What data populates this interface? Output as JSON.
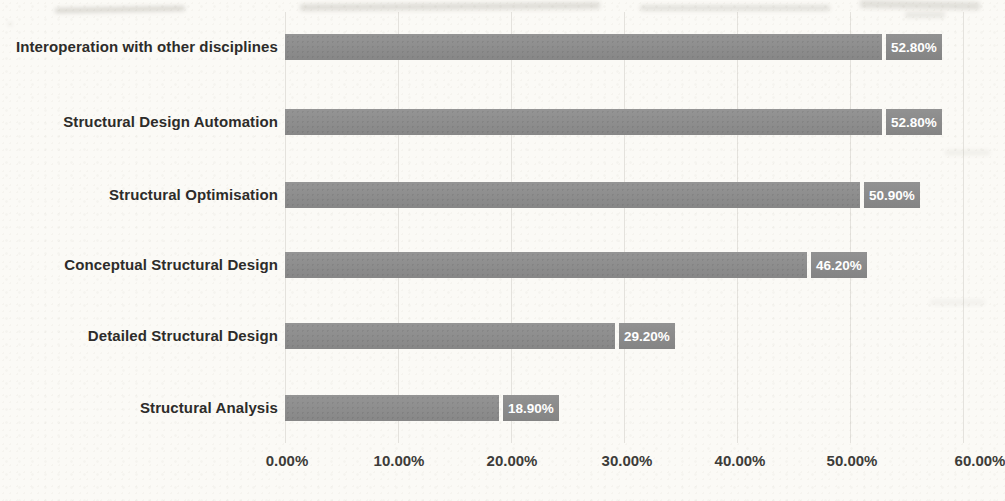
{
  "chart_data": {
    "type": "bar",
    "orientation": "horizontal",
    "title": "",
    "xlabel": "",
    "ylabel": "",
    "categories": [
      "Interoperation with other disciplines",
      "Structural Design Automation",
      "Structural Optimisation",
      "Conceptual Structural Design",
      "Detailed Structural Design",
      "Structural Analysis"
    ],
    "values": [
      52.8,
      52.8,
      50.9,
      46.2,
      29.2,
      18.9
    ],
    "data_labels": [
      "52.80%",
      "52.80%",
      "50.90%",
      "46.20%",
      "29.20%",
      "18.90%"
    ],
    "xlim": [
      0,
      60
    ],
    "xticks": [
      0,
      10,
      20,
      30,
      40,
      50,
      60
    ],
    "xtick_labels": [
      "0.00%",
      "10.00%",
      "20.00%",
      "30.00%",
      "40.00%",
      "50.00%",
      "60.00%"
    ],
    "grid": "faint vertical gridlines at each x tick",
    "legend": "none",
    "colors": {
      "bar": "#8e8e8e",
      "data_label_box": "#8c8c8c",
      "data_label_text": "#ffffff",
      "category_text": "#2d2c2a",
      "axis_text": "#3d3c39",
      "background": "#fbfaf6",
      "gridline": "#e0ded6"
    }
  }
}
